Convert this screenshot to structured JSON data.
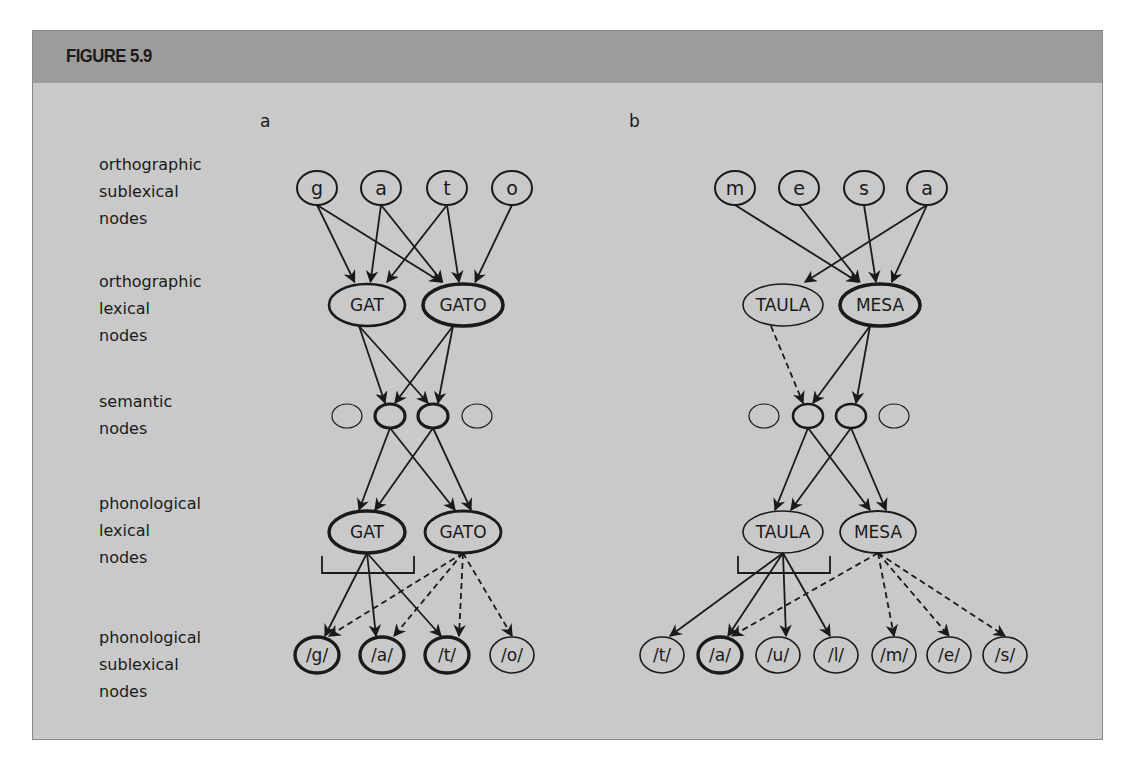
{
  "figure": {
    "title": "FIGURE 5.9",
    "colors": {
      "header": "#9c9c9c",
      "body": "#c9c9c9",
      "stroke": "#1a1a1a"
    }
  },
  "row_labels": [
    "orthographic\nsublexical\nnodes",
    "orthographic\nlexical\nnodes",
    "semantic\nnodes",
    "phonological\nlexical\nnodes",
    "phonological\nsublexical\nnodes"
  ],
  "panels": [
    {
      "label": "a",
      "orthographic_sublexical": [
        {
          "text": "g",
          "x": 317,
          "active": false
        },
        {
          "text": "a",
          "x": 381,
          "active": false
        },
        {
          "text": "t",
          "x": 447,
          "active": false
        },
        {
          "text": "o",
          "x": 512,
          "active": false
        }
      ],
      "orthographic_lexical": [
        {
          "text": "GAT",
          "x": 367,
          "weight": 2.6
        },
        {
          "text": "GATO",
          "x": 463,
          "weight": 3.6
        }
      ],
      "semantic": [
        {
          "x": 347,
          "weight": 1.2
        },
        {
          "x": 390,
          "weight": 3.2
        },
        {
          "x": 433,
          "weight": 3.2
        },
        {
          "x": 477,
          "weight": 1.2
        }
      ],
      "phonological_lexical": [
        {
          "text": "GAT",
          "x": 367,
          "weight": 3.4
        },
        {
          "text": "GATO",
          "x": 463,
          "weight": 2.8
        }
      ],
      "phonological_sublexical": [
        {
          "text": "/g/",
          "x": 317,
          "weight": 3.4
        },
        {
          "text": "/a/",
          "x": 382,
          "weight": 3.4
        },
        {
          "text": "/t/",
          "x": 447,
          "weight": 3.4
        },
        {
          "text": "/o/",
          "x": 512,
          "weight": 1.6
        }
      ],
      "bracket": {
        "x1": 322,
        "x2": 414
      },
      "edges_ortho": [
        [
          0,
          0
        ],
        [
          0,
          1
        ],
        [
          1,
          0
        ],
        [
          1,
          1
        ],
        [
          2,
          0
        ],
        [
          2,
          1
        ],
        [
          3,
          1
        ]
      ],
      "edges_ortho_to_sem": [
        [
          0,
          1,
          "solid"
        ],
        [
          0,
          2,
          "solid"
        ],
        [
          1,
          1,
          "solid"
        ],
        [
          1,
          2,
          "solid"
        ]
      ],
      "edges_sem_to_phon": [
        [
          1,
          0
        ],
        [
          1,
          1
        ],
        [
          2,
          0
        ],
        [
          2,
          1
        ]
      ],
      "edges_phon_solid": [
        [
          0,
          0
        ],
        [
          0,
          1
        ],
        [
          0,
          2
        ]
      ],
      "edges_phon_dashed": [
        [
          1,
          0
        ],
        [
          1,
          1
        ],
        [
          1,
          2
        ],
        [
          1,
          3
        ]
      ]
    },
    {
      "label": "b",
      "orthographic_sublexical": [
        {
          "text": "m",
          "x": 735,
          "active": false
        },
        {
          "text": "e",
          "x": 799,
          "active": false
        },
        {
          "text": "s",
          "x": 864,
          "active": false
        },
        {
          "text": "a",
          "x": 927,
          "active": false
        }
      ],
      "orthographic_lexical": [
        {
          "text": "TAULA",
          "x": 783,
          "weight": 1.6
        },
        {
          "text": "MESA",
          "x": 880,
          "weight": 3.6
        }
      ],
      "semantic": [
        {
          "x": 764,
          "weight": 1.2
        },
        {
          "x": 808,
          "weight": 2.6
        },
        {
          "x": 851,
          "weight": 2.6
        },
        {
          "x": 894,
          "weight": 1.2
        }
      ],
      "phonological_lexical": [
        {
          "text": "TAULA",
          "x": 783,
          "weight": 1.6
        },
        {
          "text": "MESA",
          "x": 878,
          "weight": 1.8
        }
      ],
      "phonological_sublexical": [
        {
          "text": "/t/",
          "x": 662,
          "weight": 1.6
        },
        {
          "text": "/a/",
          "x": 720,
          "weight": 3.4
        },
        {
          "text": "/u/",
          "x": 778,
          "weight": 1.6
        },
        {
          "text": "/l/",
          "x": 836,
          "weight": 1.6
        },
        {
          "text": "/m/",
          "x": 894,
          "weight": 1.6
        },
        {
          "text": "/e/",
          "x": 949,
          "weight": 1.6
        },
        {
          "text": "/s/",
          "x": 1005,
          "weight": 1.6
        }
      ],
      "bracket": {
        "x1": 738,
        "x2": 830
      },
      "edges_ortho": [
        [
          0,
          1
        ],
        [
          1,
          1
        ],
        [
          2,
          1
        ],
        [
          3,
          1
        ],
        [
          3,
          0
        ]
      ],
      "edges_ortho_to_sem": [
        [
          0,
          1,
          "dashed"
        ],
        [
          1,
          1,
          "solid"
        ],
        [
          1,
          2,
          "solid"
        ]
      ],
      "edges_sem_to_phon": [
        [
          1,
          0
        ],
        [
          1,
          1
        ],
        [
          2,
          0
        ],
        [
          2,
          1
        ]
      ],
      "edges_phon_solid": [
        [
          0,
          0
        ],
        [
          0,
          1
        ],
        [
          0,
          2
        ],
        [
          0,
          3
        ]
      ],
      "edges_phon_dashed": [
        [
          1,
          1
        ],
        [
          1,
          4
        ],
        [
          1,
          5
        ],
        [
          1,
          6
        ]
      ]
    }
  ]
}
